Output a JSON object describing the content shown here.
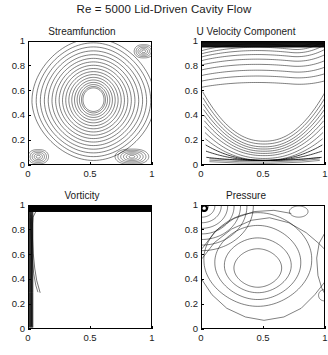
{
  "figure": {
    "title": "Re = 5000 Lid-Driven Cavity Flow",
    "background": "#ffffff",
    "line_color": "#000000"
  },
  "axes_common": {
    "xlabel": "",
    "ylabel": "",
    "xlim": [
      0,
      1
    ],
    "ylim": [
      0,
      1
    ],
    "xticks": [
      "0",
      "0.5",
      "1"
    ],
    "xtick_values": [
      0,
      0.5,
      1
    ],
    "yticks": [
      "0",
      "0.2",
      "0.4",
      "0.6",
      "0.8",
      "1"
    ],
    "ytick_values": [
      0,
      0.2,
      0.4,
      0.6,
      0.8,
      1
    ],
    "grid": false,
    "box": true
  },
  "panels": [
    {
      "id": "streamfunction",
      "title": "Streamfunction",
      "position": "top-left"
    },
    {
      "id": "u-velocity",
      "title": "U Velocity Component",
      "position": "top-right"
    },
    {
      "id": "vorticity",
      "title": "Vorticity",
      "position": "bottom-left"
    },
    {
      "id": "pressure",
      "title": "Pressure",
      "position": "bottom-right"
    }
  ],
  "chart_data": [
    {
      "type": "line",
      "plot_kind": "contour",
      "id": "streamfunction",
      "title": "Streamfunction",
      "xlabel": "",
      "ylabel": "",
      "xlim": [
        0,
        1
      ],
      "ylim": [
        0,
        1
      ],
      "xticks": [
        0,
        0.5,
        1
      ],
      "yticks": [
        0,
        0.2,
        0.4,
        0.6,
        0.8,
        1
      ],
      "grid": false,
      "features": {
        "primary_vortex_center": [
          0.52,
          0.535
        ],
        "primary_vortex_rings": 17,
        "innermost_radius_xy": [
          0.085,
          0.095
        ],
        "outermost_radius_xy": [
          0.455,
          0.46
        ],
        "corner_vortices": [
          {
            "name": "bottom-left",
            "center": [
              0.075,
              0.075
            ],
            "rings": 5,
            "radius_xy": [
              0.07,
              0.07
            ]
          },
          {
            "name": "bottom-right",
            "center": [
              0.83,
              0.075
            ],
            "rings": 6,
            "radius_xy": [
              0.115,
              0.075
            ]
          },
          {
            "name": "top-right",
            "center": [
              0.925,
              0.925
            ],
            "rings": 5,
            "radius_xy": [
              0.065,
              0.065
            ]
          }
        ]
      }
    },
    {
      "type": "line",
      "plot_kind": "contour",
      "id": "u-velocity",
      "title": "U Velocity Component",
      "xlabel": "",
      "ylabel": "",
      "xlim": [
        0,
        1
      ],
      "ylim": [
        0,
        1
      ],
      "xticks": [
        0,
        0.5,
        1
      ],
      "yticks": [
        0,
        0.2,
        0.4,
        0.6,
        0.8,
        1
      ],
      "grid": false,
      "features": {
        "lid_boundary_layer_top": 0.955,
        "upper_arc_levels": [
          0.93,
          0.905,
          0.88,
          0.85,
          0.815,
          0.775,
          0.73,
          0.685,
          0.635
        ],
        "lower_bowl_levels": [
          0.6,
          0.55,
          0.5,
          0.455,
          0.41,
          0.365,
          0.32,
          0.27,
          0.22,
          0.17,
          0.12,
          0.07
        ],
        "bowl_center_x": 0.5,
        "dense_band_near_bottom": true
      }
    },
    {
      "type": "line",
      "plot_kind": "contour",
      "id": "vorticity",
      "title": "Vorticity",
      "xlabel": "",
      "ylabel": "",
      "xlim": [
        0,
        1
      ],
      "ylim": [
        0,
        1
      ],
      "xticks": [
        0,
        0.5,
        1
      ],
      "yticks": [
        0,
        0.2,
        0.4,
        0.6,
        0.8,
        1
      ],
      "grid": false,
      "features": {
        "lid_dark_band_y": [
          0.965,
          1.0
        ],
        "left_wall_layer_x": [
          0.0,
          0.03
        ],
        "interior_blank": true,
        "peeling_contour_end": [
          0.09,
          0.3
        ],
        "right_wall_faint_x": 0.995
      }
    },
    {
      "type": "line",
      "plot_kind": "contour",
      "id": "pressure",
      "title": "Pressure",
      "xlabel": "",
      "ylabel": "",
      "xlim": [
        0,
        1
      ],
      "ylim": [
        0,
        1
      ],
      "xticks": [
        0,
        0.5,
        1
      ],
      "yticks": [
        0,
        0.2,
        0.4,
        0.6,
        0.8,
        1
      ],
      "grid": false,
      "features": {
        "central_blob_center": [
          0.45,
          0.5
        ],
        "central_rings": 4,
        "corner_singularity": [
          0.0,
          1.0
        ],
        "corner_arc_count": 8,
        "small_closed_contours": [
          {
            "center": [
              0.78,
              0.955
            ],
            "radius_xy": [
              0.075,
              0.045
            ]
          },
          {
            "center": [
              0.985,
              0.28
            ],
            "radius_xy": [
              0.045,
              0.045
            ]
          }
        ]
      }
    }
  ]
}
